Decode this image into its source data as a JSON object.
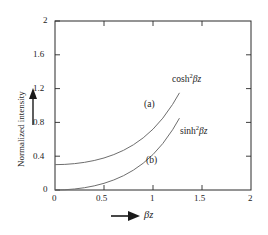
{
  "chart_data": {
    "type": "line",
    "title": "",
    "subtitle": "",
    "xlabel": "βz",
    "ylabel": "Normalized intensity",
    "xlim": [
      0,
      2
    ],
    "ylim": [
      0,
      2
    ],
    "xticks": [
      "0",
      "0.5",
      "1",
      "1.5",
      "2"
    ],
    "xtick_values": [
      0,
      0.5,
      1,
      1.5,
      2
    ],
    "yticks": [
      "0",
      "0.4",
      "0.8",
      "1.2",
      "1.6",
      "2"
    ],
    "ytick_values": [
      0,
      0.4,
      0.8,
      1.2,
      1.6,
      2
    ],
    "grid": false,
    "legend_position": "inline-annotation",
    "series": [
      {
        "name": "cosh²βz",
        "label": "(a)",
        "color": "#6e6e6e",
        "x": [
          0.0,
          0.1,
          0.2,
          0.3,
          0.4,
          0.5,
          0.6,
          0.7,
          0.8,
          0.9,
          1.0,
          1.1,
          1.2,
          1.27
        ],
        "y": [
          0.3,
          0.303,
          0.312,
          0.327,
          0.349,
          0.379,
          0.419,
          0.47,
          0.535,
          0.617,
          0.72,
          0.85,
          1.013,
          1.15
        ]
      },
      {
        "name": "sinh²βz",
        "label": "(b)",
        "color": "#6e6e6e",
        "x": [
          0.0,
          0.1,
          0.2,
          0.3,
          0.4,
          0.5,
          0.6,
          0.7,
          0.8,
          0.9,
          1.0,
          1.1,
          1.2,
          1.27
        ],
        "y": [
          0.0,
          0.003,
          0.012,
          0.027,
          0.049,
          0.079,
          0.119,
          0.17,
          0.235,
          0.317,
          0.42,
          0.55,
          0.713,
          0.85
        ]
      }
    ],
    "annotations": [
      {
        "text": "cosh",
        "exponent": "2",
        "suffix": "βz",
        "name": "cosh-label"
      },
      {
        "text": "sinh",
        "exponent": "2",
        "suffix": "βz",
        "name": "sinh-label"
      },
      {
        "text": "(a)",
        "name": "curve-a-label"
      },
      {
        "text": "(b)",
        "name": "curve-b-label"
      }
    ],
    "axis_arrows": {
      "y_arrow": "up-arrow",
      "x_arrow": "right-arrow"
    },
    "colors": {
      "frame": "#2a2a2a",
      "curve": "#6e6e6e",
      "text": "#232323",
      "background": "#ffffff"
    }
  }
}
